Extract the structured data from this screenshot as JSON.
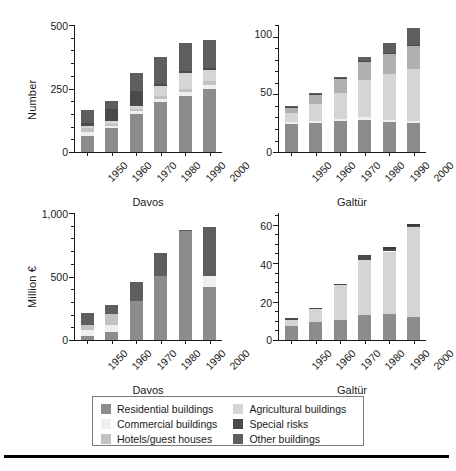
{
  "figure": {
    "background": "#ffffff",
    "bottom_rule": true
  },
  "legend": {
    "position": "bottom-center",
    "items": [
      {
        "label": "Residential buildings",
        "color": "#8c8c8c",
        "key": "residential"
      },
      {
        "label": "Agricultural buildings",
        "color": "#d5d5d5",
        "key": "agricultural"
      },
      {
        "label": "Commercial buildings",
        "color": "#efefef",
        "key": "commercial"
      },
      {
        "label": "Special risks",
        "color": "#4a4a4a",
        "key": "special"
      },
      {
        "label": "Hotels/guest houses",
        "color": "#c2c2c2",
        "key": "hotels"
      },
      {
        "label": "Other buildings",
        "color": "#5e5e5e",
        "key": "other"
      }
    ]
  },
  "chart_data": [
    {
      "id": "davos-number",
      "type": "bar",
      "stacked": true,
      "title": "",
      "panel_label": "Davos",
      "xlabel": "",
      "ylabel": "Number",
      "categories": [
        "1950",
        "1960",
        "1970",
        "1980",
        "1990",
        "2000"
      ],
      "ylim": [
        0,
        500
      ],
      "yticks": [
        0,
        250,
        500
      ],
      "ytick_labels": [
        "0",
        "250",
        "500"
      ],
      "yminor_step": 50,
      "grid": false,
      "series": [
        {
          "name": "Residential buildings",
          "color": "#8c8c8c",
          "values": [
            63,
            95,
            150,
            196,
            222,
            250
          ]
        },
        {
          "name": "Commercial buildings",
          "color": "#efefef",
          "values": [
            14,
            8,
            10,
            12,
            14,
            14
          ]
        },
        {
          "name": "Hotels/guest houses",
          "color": "#c2c2c2",
          "values": [
            18,
            8,
            10,
            12,
            14,
            14
          ]
        },
        {
          "name": "Agricultural buildings",
          "color": "#d5d5d5",
          "values": [
            8,
            10,
            12,
            38,
            62,
            46
          ]
        },
        {
          "name": "Special risks",
          "color": "#4a4a4a",
          "values": [
            10,
            48,
            60,
            8,
            8,
            8
          ]
        },
        {
          "name": "Other buildings",
          "color": "#5e5e5e",
          "values": [
            52,
            30,
            70,
            110,
            110,
            110
          ]
        }
      ],
      "totals": [
        165,
        199,
        312,
        376,
        430,
        442
      ]
    },
    {
      "id": "galtuer-number",
      "type": "bar",
      "stacked": true,
      "title": "",
      "panel_label": "Galtür",
      "xlabel": "",
      "ylabel": "",
      "categories": [
        "1950",
        "1960",
        "1970",
        "1980",
        "1990",
        "2000"
      ],
      "ylim": [
        0,
        110
      ],
      "yticks": [
        0,
        50,
        100
      ],
      "ytick_labels": [
        "0",
        "50",
        "100"
      ],
      "yminor_step": 10,
      "grid": false,
      "series": [
        {
          "name": "Residential buildings",
          "color": "#8c8c8c",
          "values": [
            24,
            25,
            27,
            28,
            26,
            25
          ]
        },
        {
          "name": "Commercial buildings",
          "color": "#efefef",
          "values": [
            2,
            2,
            2,
            2,
            2,
            2
          ]
        },
        {
          "name": "Hotels/guest houses",
          "color": "#d5d5d5",
          "values": [
            8,
            15,
            22,
            32,
            40,
            45
          ]
        },
        {
          "name": "Agricultural buildings",
          "color": "#b0b0b0",
          "values": [
            4,
            7,
            12,
            16,
            17,
            20
          ]
        },
        {
          "name": "Special risks",
          "color": "#4a4a4a",
          "values": [
            1,
            1,
            1,
            1,
            1,
            1
          ]
        },
        {
          "name": "Other buildings",
          "color": "#5e5e5e",
          "values": [
            1,
            1,
            1,
            3,
            8,
            14
          ]
        }
      ],
      "totals": [
        40,
        51,
        65,
        82,
        94,
        107
      ]
    },
    {
      "id": "davos-million-euro",
      "type": "bar",
      "stacked": true,
      "title": "",
      "panel_label": "Davos",
      "xlabel": "",
      "ylabel": "Million €",
      "categories": [
        "1950",
        "1960",
        "1970",
        "1980",
        "1990",
        "2000"
      ],
      "ylim": [
        0,
        1000
      ],
      "yticks": [
        0,
        500,
        1000
      ],
      "ytick_labels": [
        "0",
        "500",
        "1,000"
      ],
      "yminor_step": 100,
      "grid": false,
      "series": [
        {
          "name": "Residential buildings",
          "color": "#8c8c8c",
          "values": [
            30,
            60,
            310,
            505,
            855,
            415
          ]
        },
        {
          "name": "Commercial buildings",
          "color": "#efefef",
          "values": [
            50,
            55,
            0,
            0,
            0,
            90
          ]
        },
        {
          "name": "Hotels/guest houses",
          "color": "#c2c2c2",
          "values": [
            40,
            90,
            0,
            0,
            0,
            0
          ]
        },
        {
          "name": "Agricultural buildings",
          "color": "#d5d5d5",
          "values": [
            0,
            0,
            0,
            0,
            0,
            0
          ]
        },
        {
          "name": "Special risks",
          "color": "#4a4a4a",
          "values": [
            0,
            0,
            0,
            0,
            0,
            0
          ]
        },
        {
          "name": "Other buildings",
          "color": "#5e5e5e",
          "values": [
            90,
            70,
            150,
            180,
            15,
            385
          ]
        }
      ],
      "totals": [
        210,
        275,
        460,
        685,
        870,
        890
      ]
    },
    {
      "id": "galtuer-million-euro",
      "type": "bar",
      "stacked": true,
      "title": "",
      "panel_label": "Galtür",
      "xlabel": "",
      "ylabel": "",
      "categories": [
        "1950",
        "1960",
        "1970",
        "1980",
        "1990",
        "2000"
      ],
      "ylim": [
        0,
        66
      ],
      "yticks": [
        0,
        20,
        40,
        60
      ],
      "ytick_labels": [
        "0",
        "20",
        "40",
        "60"
      ],
      "yminor_step": 5,
      "grid": false,
      "series": [
        {
          "name": "Residential buildings",
          "color": "#8c8c8c",
          "values": [
            7.5,
            9.5,
            10.5,
            13,
            13.5,
            12
          ]
        },
        {
          "name": "Commercial buildings",
          "color": "#efefef",
          "values": [
            0,
            0,
            0,
            0,
            0,
            0
          ]
        },
        {
          "name": "Hotels/guest houses",
          "color": "#d5d5d5",
          "values": [
            3,
            6.5,
            18,
            28.5,
            32.5,
            46.5
          ]
        },
        {
          "name": "Agricultural buildings",
          "color": "#d5d5d5",
          "values": [
            0,
            0,
            0,
            0,
            0,
            0
          ]
        },
        {
          "name": "Special risks",
          "color": "#4a4a4a",
          "values": [
            0.8,
            0.4,
            0.6,
            2.5,
            1.2,
            0.5
          ]
        },
        {
          "name": "Other buildings",
          "color": "#3a3a3a",
          "values": [
            0,
            0,
            0,
            0,
            1.2,
            1.5
          ]
        }
      ],
      "totals": [
        11.3,
        16.4,
        29.1,
        44,
        48.4,
        60.5
      ]
    }
  ]
}
